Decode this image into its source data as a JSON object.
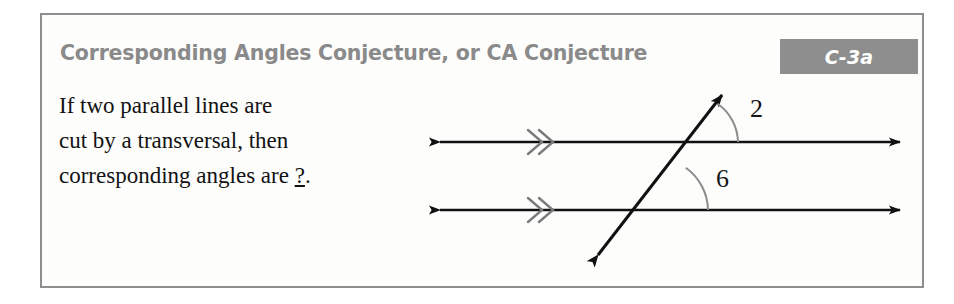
{
  "card": {
    "title": "Corresponding Angles Conjecture, or CA Conjecture",
    "badge": "C-3a",
    "statement_lines": [
      "If two parallel lines are",
      "cut by a transversal, then"
    ],
    "statement_last_prefix": "corresponding angles are ",
    "statement_blank": "?",
    "statement_last_suffix": "."
  },
  "diagram": {
    "angle_top_label": "2",
    "angle_bottom_label": "6",
    "line_color": "#111111",
    "mark_color": "#7a7a7a",
    "arc_color": "#8c8c8c",
    "label_color": "#151515",
    "top_line_label": "parallel-line-top",
    "bottom_line_label": "parallel-line-bottom",
    "transversal_label": "transversal-line"
  },
  "colors": {
    "title_gray": "#8a8a8a",
    "badge_gray": "#8e8e8e",
    "badge_text": "#ffffff",
    "border_gray": "#8e8e8e",
    "page_background": "#ffffff",
    "card_background": "#fdfdfc",
    "body_text": "#121212"
  }
}
